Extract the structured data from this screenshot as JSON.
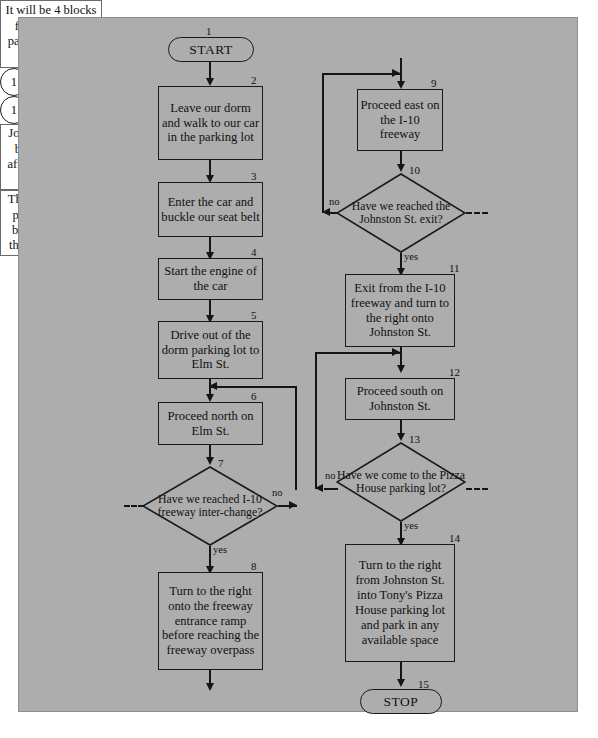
{
  "diagram": {
    "background_color": "#adadad",
    "note_color": "#ffffff",
    "line_color": "#151515"
  },
  "terminals": {
    "start": {
      "number": "1",
      "label": "START"
    },
    "stop": {
      "number": "15",
      "label": "STOP"
    }
  },
  "connectors": {
    "left_bottom": {
      "label": "1"
    },
    "right_top": {
      "label": "1"
    }
  },
  "steps": [
    {
      "number": "2",
      "text": "Leave our dorm and walk to our car in the parking lot"
    },
    {
      "number": "3",
      "text": "Enter the car and buckle our seat belt"
    },
    {
      "number": "4",
      "text": "Start the engine of the car"
    },
    {
      "number": "5",
      "text": "Drive out of the dorm parking lot to Elm St."
    },
    {
      "number": "6",
      "text": "Proceed north on Elm St."
    },
    {
      "number": "8",
      "text": "Turn to the right onto the freeway entrance ramp before reaching the freeway overpass"
    },
    {
      "number": "9",
      "text": "Proceed east on the I-10 freeway"
    },
    {
      "number": "11",
      "text": "Exit from the I-10 freeway and turn to the right onto Johnston St."
    },
    {
      "number": "12",
      "text": "Proceed south on Johnston St."
    },
    {
      "number": "14",
      "text": "Turn to the right from Johnston St. into Tony's Pizza House parking lot and park in any available space"
    }
  ],
  "decisions": [
    {
      "number": "7",
      "text": "Have we reached I-10 freeway inter-change?",
      "yes_label": "yes",
      "no_label": "no"
    },
    {
      "number": "10",
      "text": "Have we reached the Johnston St. exit?",
      "yes_label": "yes",
      "no_label": "no"
    },
    {
      "number": "13",
      "text": "Have we come to  the Pizza House parking lot?",
      "yes_label": "yes",
      "no_label": "no"
    }
  ],
  "notes": [
    {
      "id": "note-left",
      "text": "It will be 4 blocks from the dorm parking lot to the I-10 freeway"
    },
    {
      "id": "note-johnston",
      "text": "Johnston St. will be the 8th exit after entering the I-10 freeway"
    },
    {
      "id": "note-pizza-house",
      "text": "The Pizza House parking lot is 6 blocks south of the I-10 freeway"
    }
  ]
}
